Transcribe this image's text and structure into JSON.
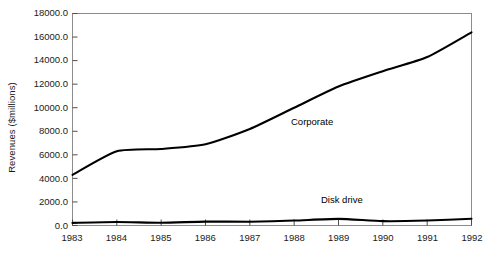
{
  "chart_data": {
    "type": "line",
    "title": "",
    "xlabel": "",
    "ylabel": "Revenues ($millions)",
    "categories": [
      "1983",
      "1984",
      "1985",
      "1986",
      "1987",
      "1988",
      "1989",
      "1990",
      "1991",
      "1992"
    ],
    "x": [
      1983,
      1984,
      1985,
      1986,
      1987,
      1988,
      1989,
      1990,
      1991,
      1992
    ],
    "xlim": [
      1983,
      1992
    ],
    "ylim": [
      0,
      18000
    ],
    "ytick_labels": [
      "18000.0",
      "16000.0",
      "14000.0",
      "12000.0",
      "10000.0",
      "8000.0",
      "6000.0",
      "4000.0",
      "2000.0",
      "0.0"
    ],
    "ytick_values": [
      18000,
      16000,
      14000,
      12000,
      10000,
      8000,
      6000,
      4000,
      2000,
      0
    ],
    "ytick_step": 2000,
    "grid": false,
    "legend_position": "inline-labels",
    "series": [
      {
        "name": "Corporate",
        "values": [
          4300,
          6300,
          6500,
          6900,
          8200,
          10000,
          11800,
          13100,
          14300,
          16400
        ],
        "color": "#000000",
        "label_text": "Corporate"
      },
      {
        "name": "Disk drive",
        "values": [
          220,
          300,
          230,
          330,
          320,
          420,
          560,
          370,
          420,
          570
        ],
        "color": "#000000",
        "label_text": "Disk drive"
      }
    ]
  },
  "axes": {
    "frame_color": "#808080",
    "tick_color": "#4d4d4d",
    "line_color": "#000000"
  }
}
